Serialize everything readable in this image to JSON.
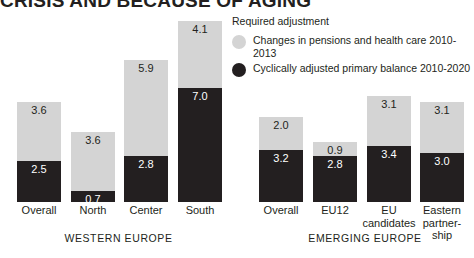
{
  "title": "CRISIS AND BECAUSE OF AGING",
  "legend": {
    "heading": "Required adjustment",
    "items": [
      {
        "label": "Changes in pensions and health care 2010-2013",
        "color": "#d4d4d4",
        "marker": "circle-light-icon"
      },
      {
        "label": "Cyclically adjusted primary balance 2010-2020",
        "color": "#231f20",
        "marker": "circle-dark-icon"
      }
    ]
  },
  "groups": [
    {
      "caption": "WESTERN EUROPE"
    },
    {
      "caption": "EMERGING EUROPE"
    }
  ],
  "chart_data": {
    "type": "bar",
    "title": "CRISIS AND BECAUSE OF AGING",
    "xlabel": "",
    "ylabel": "",
    "stacked": true,
    "grid": false,
    "legend_position": "top-right",
    "ylim": [
      0,
      11.1
    ],
    "group_labels": [
      "WESTERN EUROPE",
      "EMERGING EUROPE"
    ],
    "categories": [
      "Overall",
      "North",
      "Center",
      "South",
      "Overall",
      "EU12",
      "EU candidates",
      "Eastern partner-ship"
    ],
    "category_groups": [
      "WESTERN EUROPE",
      "WESTERN EUROPE",
      "WESTERN EUROPE",
      "WESTERN EUROPE",
      "EMERGING EUROPE",
      "EMERGING EUROPE",
      "EMERGING EUROPE",
      "EMERGING EUROPE"
    ],
    "series": [
      {
        "name": "Cyclically adjusted primary balance 2010-2020",
        "color": "#231f20",
        "values": [
          2.5,
          0.7,
          2.8,
          7.0,
          3.2,
          2.8,
          3.4,
          3.0
        ]
      },
      {
        "name": "Changes in pensions and health care 2010-2013",
        "color": "#d4d4d4",
        "values": [
          3.6,
          3.6,
          5.9,
          4.1,
          2.0,
          0.9,
          3.1,
          3.1
        ]
      }
    ],
    "totals": [
      6.1,
      4.3,
      8.7,
      11.1,
      5.2,
      3.7,
      6.5,
      6.1
    ]
  },
  "bars": [
    {
      "name": "Overall",
      "label_lines": [
        "Overall"
      ],
      "dark": "2.5",
      "light": "3.6",
      "x": 17,
      "w": 44
    },
    {
      "name": "North",
      "label_lines": [
        "North"
      ],
      "dark": "0.7",
      "light": "3.6",
      "x": 71,
      "w": 44
    },
    {
      "name": "Center",
      "label_lines": [
        "Center"
      ],
      "dark": "2.8",
      "light": "5.9",
      "x": 124,
      "w": 44
    },
    {
      "name": "South",
      "label_lines": [
        "South"
      ],
      "dark": "7.0",
      "light": "4.1",
      "x": 178,
      "w": 44
    },
    {
      "name": "Overall",
      "label_lines": [
        "Overall"
      ],
      "dark": "3.2",
      "light": "2.0",
      "x": 259,
      "w": 44
    },
    {
      "name": "EU12",
      "label_lines": [
        "EU12"
      ],
      "dark": "2.8",
      "light": "0.9",
      "x": 313,
      "w": 44
    },
    {
      "name": "EU candidates",
      "label_lines": [
        "EU",
        "candidates"
      ],
      "dark": "3.4",
      "light": "3.1",
      "x": 367,
      "w": 44
    },
    {
      "name": "Eastern partnership",
      "label_lines": [
        "Eastern",
        "partner-",
        "ship"
      ],
      "dark": "3.0",
      "light": "3.1",
      "x": 420,
      "w": 44
    }
  ]
}
